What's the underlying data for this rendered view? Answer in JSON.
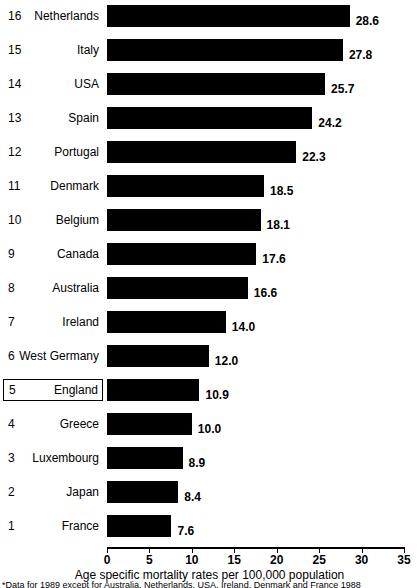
{
  "chart_data": {
    "type": "bar",
    "orientation": "horizontal",
    "title": "",
    "xlabel": "Age specific mortality rates per 100,000 population",
    "ylabel": "",
    "xlim": [
      0,
      35
    ],
    "xticks": [
      0,
      5,
      10,
      15,
      20,
      25,
      30,
      35
    ],
    "xtick_labels": [
      "0",
      "5",
      "10",
      "15",
      "20",
      "25",
      "30",
      "35"
    ],
    "grid": false,
    "legend": null,
    "bar_color": "#000000",
    "categories": [
      "Netherlands",
      "Italy",
      "USA",
      "Spain",
      "Portugal",
      "Denmark",
      "Belgium",
      "Canada",
      "Australia",
      "Ireland",
      "West Germany",
      "England",
      "Greece",
      "Luxembourg",
      "Japan",
      "France"
    ],
    "values": [
      28.6,
      27.8,
      25.7,
      24.2,
      22.3,
      18.5,
      18.1,
      17.6,
      16.6,
      14.0,
      12.0,
      10.9,
      10.0,
      8.9,
      8.4,
      7.6
    ],
    "ranks": [
      16,
      15,
      14,
      13,
      12,
      11,
      10,
      9,
      8,
      7,
      6,
      5,
      4,
      3,
      2,
      1
    ],
    "value_labels": [
      "28.6",
      "27.8",
      "25.7",
      "24.2",
      "22.3",
      "18.5",
      "18.1",
      "17.6",
      "16.6",
      "14.0",
      "12.0",
      "10.9",
      "10.0",
      "8.9",
      "8.4",
      "7.6"
    ],
    "highlighted": "England"
  },
  "rows": [
    {
      "rank": "16",
      "country": "Netherlands",
      "value": "28.6",
      "value_num": 28.6,
      "boxed": false
    },
    {
      "rank": "15",
      "country": "Italy",
      "value": "27.8",
      "value_num": 27.8,
      "boxed": false
    },
    {
      "rank": "14",
      "country": "USA",
      "value": "25.7",
      "value_num": 25.7,
      "boxed": false
    },
    {
      "rank": "13",
      "country": "Spain",
      "value": "24.2",
      "value_num": 24.2,
      "boxed": false
    },
    {
      "rank": "12",
      "country": "Portugal",
      "value": "22.3",
      "value_num": 22.3,
      "boxed": false
    },
    {
      "rank": "11",
      "country": "Denmark",
      "value": "18.5",
      "value_num": 18.5,
      "boxed": false
    },
    {
      "rank": "10",
      "country": "Belgium",
      "value": "18.1",
      "value_num": 18.1,
      "boxed": false
    },
    {
      "rank": "9",
      "country": "Canada",
      "value": "17.6",
      "value_num": 17.6,
      "boxed": false
    },
    {
      "rank": "8",
      "country": "Australia",
      "value": "16.6",
      "value_num": 16.6,
      "boxed": false
    },
    {
      "rank": "7",
      "country": "Ireland",
      "value": "14.0",
      "value_num": 14.0,
      "boxed": false
    },
    {
      "rank": "6",
      "country": "West Germany",
      "value": "12.0",
      "value_num": 12.0,
      "boxed": false
    },
    {
      "rank": "5",
      "country": "England",
      "value": "10.9",
      "value_num": 10.9,
      "boxed": true
    },
    {
      "rank": "4",
      "country": "Greece",
      "value": "10.0",
      "value_num": 10.0,
      "boxed": false
    },
    {
      "rank": "3",
      "country": "Luxembourg",
      "value": "8.9",
      "value_num": 8.9,
      "boxed": false
    },
    {
      "rank": "2",
      "country": "Japan",
      "value": "8.4",
      "value_num": 8.4,
      "boxed": false
    },
    {
      "rank": "1",
      "country": "France",
      "value": "7.6",
      "value_num": 7.6,
      "boxed": false
    }
  ],
  "axis": {
    "title": "Age specific mortality rates per 100,000 population",
    "ticks": [
      "0",
      "5",
      "10",
      "15",
      "20",
      "25",
      "30",
      "35"
    ]
  },
  "footnote": {
    "text": "*Data for 1989 except for Australia, Netherlands, USA, Ireland, Denmark and France 1988"
  }
}
